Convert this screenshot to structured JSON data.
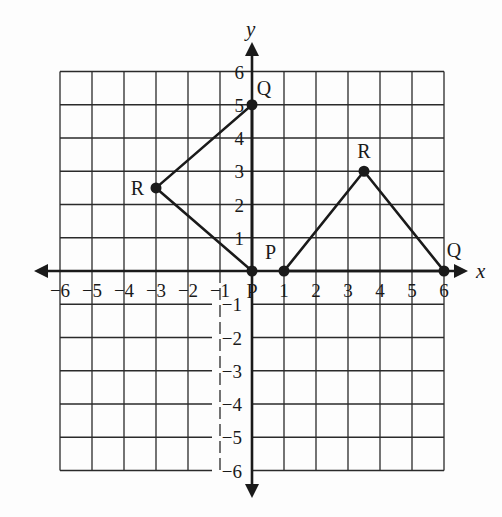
{
  "figure": {
    "width": 502,
    "height": 517,
    "colors": {
      "ink": "#1a1a1a",
      "grid": "#2a2a2a",
      "background": "#fdfdfd"
    },
    "axes": {
      "x_label": "x",
      "y_label": "y",
      "x_range": [
        -6,
        6
      ],
      "y_range": [
        -6,
        6
      ],
      "x_ticks": [
        "-6",
        "-5",
        "-4",
        "-3",
        "-2",
        "-1",
        "1",
        "2",
        "3",
        "4",
        "5",
        "6"
      ],
      "y_ticks": [
        "6",
        "5",
        "4",
        "3",
        "2",
        "1",
        "-1",
        "-2",
        "-3",
        "-4",
        "-5",
        "-6"
      ],
      "origin_label": "P",
      "grid": true
    },
    "triangles": [
      {
        "name": "left-triangle",
        "vertices": [
          {
            "label": "P",
            "x": 0,
            "y": 0
          },
          {
            "label": "Q",
            "x": 0,
            "y": 5
          },
          {
            "label": "R",
            "x": -3,
            "y": 2.5
          }
        ]
      },
      {
        "name": "right-triangle",
        "vertices": [
          {
            "label": "P",
            "x": 1,
            "y": 0
          },
          {
            "label": "Q",
            "x": 6,
            "y": 0
          },
          {
            "label": "R",
            "x": 3.5,
            "y": 3
          }
        ]
      }
    ]
  }
}
